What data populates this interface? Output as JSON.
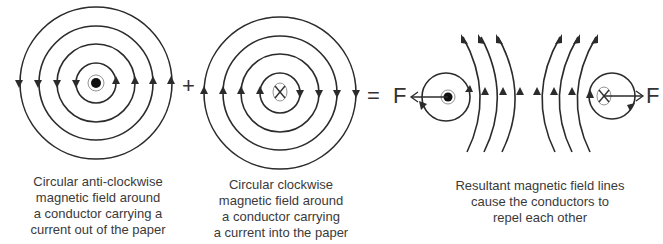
{
  "figure": {
    "panels": [
      {
        "id": "anticlockwise",
        "conductor": "current-out-of-paper",
        "symbol": "dot",
        "caption_lines": [
          "Circular anti-clockwise",
          "magnetic field around",
          "a conductor carrying a",
          "current out of the paper"
        ]
      },
      {
        "id": "clockwise",
        "conductor": "current-into-paper",
        "symbol": "cross",
        "caption_lines": [
          "Circular clockwise",
          "magnetic field around",
          "a conductor carrying",
          "a current into the paper"
        ]
      },
      {
        "id": "resultant",
        "caption_lines": [
          "Resultant magnetic field lines",
          "cause the conductors to",
          "repel each other"
        ],
        "force_left_label": "F",
        "force_right_label": "F"
      }
    ],
    "operators": {
      "plus": "+",
      "equals": "="
    },
    "colors": {
      "line": "#2b2b2b",
      "text": "#3a3a3a",
      "background": "#ffffff"
    }
  }
}
